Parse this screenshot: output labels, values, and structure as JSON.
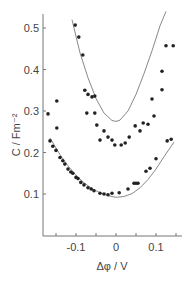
{
  "chart_data": {
    "type": "scatter",
    "title": "",
    "xlabel": "Δφ / V",
    "ylabel": "C / Fm⁻²",
    "xlim": [
      -0.18,
      0.155
    ],
    "ylim": [
      0.0,
      0.54
    ],
    "x_ticks": [
      -0.15,
      -0.1,
      -0.05,
      0,
      0.05,
      0.1,
      0.15
    ],
    "x_tick_labels": [
      {
        "value": -0.1,
        "label": "-0.1"
      },
      {
        "value": 0,
        "label": "0"
      },
      {
        "value": 0.1,
        "label": "0.1"
      }
    ],
    "y_tick_labels": [
      {
        "value": 0.1,
        "label": "0.1"
      },
      {
        "value": 0.2,
        "label": "0.2"
      },
      {
        "value": 0.3,
        "label": "0.3"
      },
      {
        "value": 0.4,
        "label": "0.4"
      },
      {
        "value": 0.5,
        "label": "0.5"
      }
    ],
    "grid": false,
    "legend": null,
    "series": [
      {
        "name": "upper data (points)",
        "kind": "scatter",
        "points": [
          [
            -0.17,
            0.293
          ],
          [
            -0.148,
            0.324
          ],
          [
            -0.148,
            0.259
          ],
          [
            -0.102,
            0.507
          ],
          [
            -0.093,
            0.478
          ],
          [
            -0.083,
            0.435
          ],
          [
            -0.078,
            0.35
          ],
          [
            -0.07,
            0.34
          ],
          [
            -0.06,
            0.334
          ],
          [
            -0.053,
            0.336
          ],
          [
            -0.073,
            0.295
          ],
          [
            -0.053,
            0.295
          ],
          [
            -0.048,
            0.266
          ],
          [
            -0.04,
            0.23
          ],
          [
            -0.03,
            0.252
          ],
          [
            -0.02,
            0.237
          ],
          [
            -0.01,
            0.23
          ],
          [
            -0.003,
            0.218
          ],
          [
            0.013,
            0.218
          ],
          [
            0.023,
            0.223
          ],
          [
            0.033,
            0.237
          ],
          [
            0.048,
            0.264
          ],
          [
            0.06,
            0.252
          ],
          [
            0.068,
            0.271
          ],
          [
            0.08,
            0.268
          ],
          [
            0.09,
            0.329
          ],
          [
            0.095,
            0.288
          ],
          [
            0.115,
            0.351
          ],
          [
            0.115,
            0.396
          ],
          [
            0.125,
            0.457
          ],
          [
            0.143,
            0.457
          ]
        ]
      },
      {
        "name": "lower data (points)",
        "kind": "scatter",
        "points": [
          [
            -0.165,
            0.228
          ],
          [
            -0.158,
            0.215
          ],
          [
            -0.15,
            0.205
          ],
          [
            -0.14,
            0.188
          ],
          [
            -0.133,
            0.18
          ],
          [
            -0.128,
            0.172
          ],
          [
            -0.12,
            0.16
          ],
          [
            -0.113,
            0.153
          ],
          [
            -0.108,
            0.15
          ],
          [
            -0.1,
            0.14
          ],
          [
            -0.095,
            0.137
          ],
          [
            -0.088,
            0.128
          ],
          [
            -0.08,
            0.122
          ],
          [
            -0.07,
            0.115
          ],
          [
            -0.062,
            0.112
          ],
          [
            -0.055,
            0.108
          ],
          [
            -0.04,
            0.102
          ],
          [
            -0.03,
            0.1
          ],
          [
            -0.02,
            0.098
          ],
          [
            -0.01,
            0.102
          ],
          [
            0.008,
            0.103
          ],
          [
            0.03,
            0.112
          ],
          [
            0.045,
            0.126
          ],
          [
            0.05,
            0.126
          ],
          [
            0.055,
            0.126
          ],
          [
            0.075,
            0.155
          ],
          [
            0.085,
            0.162
          ],
          [
            0.1,
            0.185
          ],
          [
            0.128,
            0.228
          ],
          [
            0.138,
            0.232
          ]
        ]
      },
      {
        "name": "upper fit curve",
        "kind": "line",
        "x": [
          -0.11,
          -0.09,
          -0.07,
          -0.05,
          -0.03,
          -0.01,
          0.0,
          0.01,
          0.03,
          0.05,
          0.07,
          0.09,
          0.11,
          0.125
        ],
        "y": [
          0.52,
          0.44,
          0.38,
          0.33,
          0.295,
          0.277,
          0.275,
          0.278,
          0.3,
          0.34,
          0.39,
          0.445,
          0.505,
          0.54
        ]
      },
      {
        "name": "lower fit curve",
        "kind": "line",
        "x": [
          -0.165,
          -0.14,
          -0.12,
          -0.1,
          -0.08,
          -0.06,
          -0.04,
          -0.02,
          0.0,
          0.02,
          0.04,
          0.06,
          0.08,
          0.1,
          0.12,
          0.145
        ],
        "y": [
          0.235,
          0.195,
          0.168,
          0.145,
          0.127,
          0.113,
          0.103,
          0.096,
          0.092,
          0.094,
          0.101,
          0.115,
          0.135,
          0.16,
          0.19,
          0.225
        ]
      }
    ]
  }
}
